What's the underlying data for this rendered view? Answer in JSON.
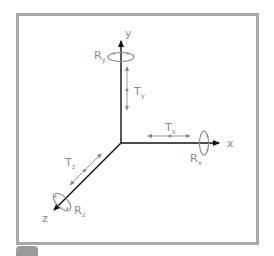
{
  "diagram": {
    "axes": [
      {
        "id": "x",
        "label": "x"
      },
      {
        "id": "y",
        "label": "y"
      },
      {
        "id": "z",
        "label": "z"
      }
    ],
    "translations": [
      {
        "id": "Tx",
        "letter": "T",
        "subscript": "x"
      },
      {
        "id": "Ty",
        "letter": "T",
        "subscript": "y"
      },
      {
        "id": "Tz",
        "letter": "T",
        "subscript": "z"
      }
    ],
    "rotations": [
      {
        "id": "Rx",
        "letter": "R",
        "subscript": "x"
      },
      {
        "id": "Ry",
        "letter": "R",
        "subscript": "y"
      },
      {
        "id": "Rz",
        "letter": "R",
        "subscript": "z"
      }
    ],
    "colors": {
      "axis": "#111111",
      "annotation": "#8a8a8a",
      "frame": "#a8a8a8"
    }
  }
}
